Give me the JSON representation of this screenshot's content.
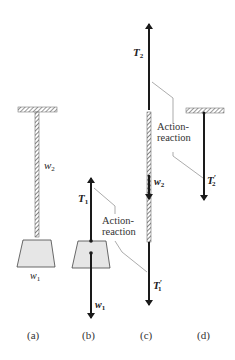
{
  "figure": {
    "panels": [
      {
        "id": "a",
        "label": "(a)",
        "description": "Block w1 hanging by rope w2 from ceiling"
      },
      {
        "id": "b",
        "label": "(b)",
        "description": "Free-body diagram of block"
      },
      {
        "id": "c",
        "label": "(c)",
        "description": "Free-body diagram of rope"
      },
      {
        "id": "d",
        "label": "(d)",
        "description": "Force on ceiling"
      }
    ],
    "labels": {
      "rope_weight": {
        "main": "w",
        "sub": "2"
      },
      "block_weight": {
        "main": "w",
        "sub": "1"
      },
      "T1": {
        "main": "T",
        "sub": "1"
      },
      "w1_vector": {
        "main": "w",
        "sub": "1"
      },
      "T2": {
        "main": "T",
        "sub": "2"
      },
      "w2_vector": {
        "main": "w",
        "sub": "2"
      },
      "T1_prime": {
        "main": "T",
        "sub": "1",
        "prime": "′"
      },
      "T2_prime": {
        "main": "T",
        "sub": "2",
        "prime": "′"
      }
    },
    "annotations": {
      "action_reaction_upper_line1": "Action-",
      "action_reaction_upper_line2": "reaction",
      "action_reaction_lower_line1": "Action-",
      "action_reaction_lower_line2": "reaction"
    },
    "colors": {
      "ink": "#1a1a1a",
      "block_fill": "#e6e6e6",
      "leader_line": "#888888"
    }
  }
}
